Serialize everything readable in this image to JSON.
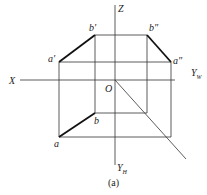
{
  "diagram": {
    "caption": "(a)",
    "axes": {
      "z": "Z",
      "x": "X",
      "origin": "O",
      "yw": "Y",
      "yw_sub": "W",
      "yh": "Y",
      "yh_sub": "H"
    },
    "points": {
      "a_prime": "a'",
      "b_prime": "b'",
      "a_dprime": "a\"",
      "b_dprime": "b\"",
      "a": "a",
      "b": "b"
    }
  }
}
